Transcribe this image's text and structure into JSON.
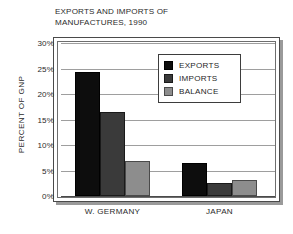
{
  "chart_data": {
    "type": "bar",
    "title": "EXPORTS AND IMPORTS OF\nMANUFACTURES, 1990",
    "xlabel": "",
    "ylabel": "PERCENT OF GNP",
    "categories": [
      "W. GERMANY",
      "JAPAN"
    ],
    "series": [
      {
        "name": "EXPORTS",
        "values": [
          24.3,
          6.5
        ],
        "color": "#0d0d0d"
      },
      {
        "name": "IMPORTS",
        "values": [
          16.5,
          2.6
        ],
        "color": "#3a3a3a"
      },
      {
        "name": "BALANCE",
        "values": [
          6.9,
          3.2
        ],
        "color": "#8d8d8d"
      }
    ],
    "ylim": [
      0,
      30
    ],
    "ytick_values": [
      0,
      5,
      10,
      15,
      20,
      25,
      30
    ],
    "ytick_labels": [
      "0%",
      "5%",
      "10%",
      "15%",
      "20%",
      "25%",
      "30%"
    ],
    "grid": true,
    "legend_position": "upper-center"
  },
  "legend": {
    "entries": [
      {
        "label": "EXPORTS",
        "swatch": "exports"
      },
      {
        "label": "IMPORTS",
        "swatch": "imports"
      },
      {
        "label": "BALANCE",
        "swatch": "balance"
      }
    ]
  }
}
